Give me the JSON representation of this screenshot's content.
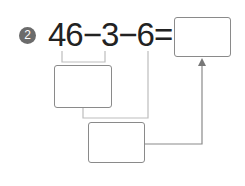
{
  "problem": {
    "number": "2",
    "expression": "46−3−6=",
    "answer_box_value": "",
    "step1_box_value": "",
    "step2_box_value": ""
  },
  "colors": {
    "badge": "#6b6b6b",
    "text": "#222222",
    "box_border": "#8a8a8a",
    "line": "#b0b0b0",
    "arrow": "#777777"
  }
}
